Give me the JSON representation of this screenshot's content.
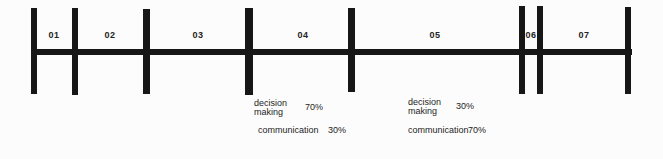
{
  "theme": {
    "background": "#fcfcfc",
    "ink": "#171717",
    "text": "#242424"
  },
  "timeline": {
    "segments": [
      {
        "label": "01"
      },
      {
        "label": "02"
      },
      {
        "label": "03"
      },
      {
        "label": "04"
      },
      {
        "label": "05"
      },
      {
        "label": "06"
      },
      {
        "label": "07"
      }
    ]
  },
  "annotations": [
    {
      "anchor": "04",
      "activity1": "decision\nmaking",
      "value1": "70%",
      "activity2": "communication",
      "value2": "30%"
    },
    {
      "anchor": "05",
      "activity1": "decision\nmaking",
      "value1": "30%",
      "activity2": "communication",
      "value2": "70%"
    }
  ]
}
